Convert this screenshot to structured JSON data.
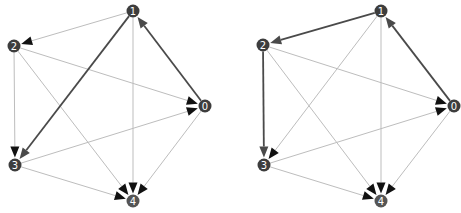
{
  "colors": {
    "node_fill": "#3d3d3d",
    "node_fill_light": "#555555",
    "edge_light": "#bdbdbd",
    "edge_dark": "#4a4a4a",
    "arrow": "#111111",
    "background": "#ffffff"
  },
  "graphs": [
    {
      "id": "left",
      "nodes": [
        {
          "id": "0",
          "label": "0",
          "x": 205,
          "y": 106
        },
        {
          "id": "1",
          "label": "1",
          "x": 133,
          "y": 11
        },
        {
          "id": "2",
          "label": "2",
          "x": 14,
          "y": 46
        },
        {
          "id": "3",
          "label": "3",
          "x": 15,
          "y": 165
        },
        {
          "id": "4",
          "label": "4",
          "x": 133,
          "y": 201
        }
      ],
      "edges": [
        {
          "from": "0",
          "to": "1",
          "highlight": true
        },
        {
          "from": "1",
          "to": "2",
          "highlight": false
        },
        {
          "from": "1",
          "to": "3",
          "highlight": true
        },
        {
          "from": "1",
          "to": "4",
          "highlight": false
        },
        {
          "from": "2",
          "to": "0",
          "highlight": false
        },
        {
          "from": "2",
          "to": "3",
          "highlight": false
        },
        {
          "from": "2",
          "to": "4",
          "highlight": false
        },
        {
          "from": "3",
          "to": "0",
          "highlight": false
        },
        {
          "from": "3",
          "to": "4",
          "highlight": false
        },
        {
          "from": "0",
          "to": "4",
          "highlight": false
        }
      ]
    },
    {
      "id": "right",
      "nodes": [
        {
          "id": "0",
          "label": "0",
          "x": 454,
          "y": 106
        },
        {
          "id": "1",
          "label": "1",
          "x": 381,
          "y": 11
        },
        {
          "id": "2",
          "label": "2",
          "x": 263,
          "y": 45
        },
        {
          "id": "3",
          "label": "3",
          "x": 264,
          "y": 165
        },
        {
          "id": "4",
          "label": "4",
          "x": 381,
          "y": 201
        }
      ],
      "edges": [
        {
          "from": "0",
          "to": "1",
          "highlight": true
        },
        {
          "from": "1",
          "to": "2",
          "highlight": true
        },
        {
          "from": "1",
          "to": "3",
          "highlight": false
        },
        {
          "from": "1",
          "to": "4",
          "highlight": false
        },
        {
          "from": "2",
          "to": "0",
          "highlight": false
        },
        {
          "from": "2",
          "to": "3",
          "highlight": true
        },
        {
          "from": "2",
          "to": "4",
          "highlight": false
        },
        {
          "from": "3",
          "to": "0",
          "highlight": false
        },
        {
          "from": "3",
          "to": "4",
          "highlight": false
        },
        {
          "from": "0",
          "to": "4",
          "highlight": false
        }
      ]
    }
  ]
}
